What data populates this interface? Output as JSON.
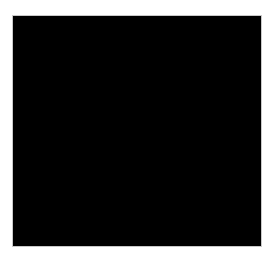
{
  "page": {
    "background_color": "#ffffff",
    "width": 274,
    "height": 259,
    "caption": ""
  },
  "plate": {
    "name": "grayscale-image-plate",
    "x": 12,
    "y": 15,
    "width": 250,
    "height": 232,
    "border_color": "#c9c9c9",
    "background_color": "#000000",
    "colormap": "grayscale",
    "alt_text": "Grayscale astronomical image: diffuse round halo with an offset bright core"
  },
  "chart_data": {
    "type": "heatmap",
    "title": "",
    "subtitle": "",
    "xlabel": "",
    "ylabel": "",
    "colormap": "gray",
    "grid": false,
    "legend": "none",
    "axis_visible": false,
    "tick_labels_x": [],
    "tick_labels_y": [],
    "xlim": [
      0,
      250
    ],
    "ylim": [
      0,
      232
    ],
    "background_level": 0.02,
    "peak_level": 1.0,
    "noise_amplitude": 0.035,
    "annotations": [],
    "features": [
      {
        "name": "outer-halo",
        "shape": "ellipse",
        "cx": 123,
        "cy": 115,
        "rx": 98,
        "ry": 96,
        "peak_level": 0.22,
        "falloff": "gaussian",
        "sigma": 62
      },
      {
        "name": "inner-halo",
        "shape": "ellipse",
        "cx": 112,
        "cy": 112,
        "rx": 72,
        "ry": 76,
        "peak_level": 0.36,
        "falloff": "gaussian",
        "sigma": 44
      },
      {
        "name": "bright-core",
        "shape": "ellipse",
        "cx": 97,
        "cy": 110,
        "rx": 26,
        "ry": 34,
        "peak_level": 1.0,
        "falloff": "gaussian",
        "sigma": 21
      },
      {
        "name": "lower-right-lobe",
        "shape": "ellipse",
        "cx": 113,
        "cy": 143,
        "rx": 34,
        "ry": 26,
        "peak_level": 0.62,
        "falloff": "gaussian",
        "sigma": 24
      },
      {
        "name": "upper-core-extension",
        "shape": "ellipse",
        "cx": 101,
        "cy": 90,
        "rx": 22,
        "ry": 24,
        "peak_level": 0.48,
        "falloff": "gaussian",
        "sigma": 19
      },
      {
        "name": "dark-notch",
        "shape": "ellipse",
        "cx": 133,
        "cy": 112,
        "rx": 16,
        "ry": 40,
        "peak_level": -0.17,
        "falloff": "gaussian",
        "sigma": 22
      },
      {
        "name": "faint-speck",
        "shape": "point",
        "cx": 83,
        "cy": 173,
        "rx": 2,
        "ry": 2,
        "peak_level": 0.3,
        "falloff": "gaussian",
        "sigma": 2
      }
    ],
    "intensity_profile_horizontal": {
      "x": [
        0,
        20,
        40,
        60,
        80,
        97,
        115,
        133,
        150,
        170,
        190,
        210,
        230,
        249
      ],
      "values": [
        0.02,
        0.03,
        0.07,
        0.22,
        0.62,
        1.0,
        0.66,
        0.31,
        0.3,
        0.25,
        0.17,
        0.09,
        0.04,
        0.02
      ]
    },
    "intensity_profile_vertical": {
      "y": [
        0,
        20,
        40,
        60,
        80,
        100,
        112,
        130,
        150,
        170,
        190,
        210,
        231
      ],
      "values": [
        0.02,
        0.04,
        0.09,
        0.2,
        0.45,
        0.86,
        1.0,
        0.72,
        0.4,
        0.19,
        0.08,
        0.04,
        0.02
      ]
    }
  }
}
